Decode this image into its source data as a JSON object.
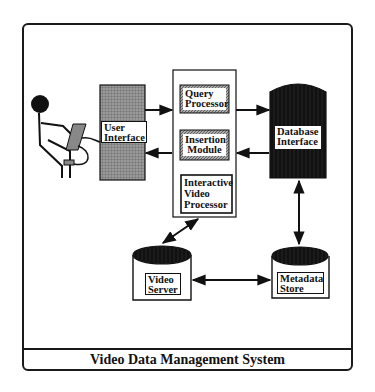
{
  "diagram": {
    "title": "Video Data Management System",
    "nodes": [
      {
        "id": "user",
        "label": "User",
        "shape": "stick-figure-with-tablet"
      },
      {
        "id": "user_interface",
        "label_line1": "User",
        "label_line2": "Interface",
        "shape": "grid-rect"
      },
      {
        "id": "query_processor",
        "label_line1": "Query",
        "label_line2": "Processor",
        "shape": "hatched-rect"
      },
      {
        "id": "insertion_module",
        "label_line1": "Insertion",
        "label_line2": "Module",
        "shape": "hatched-rect"
      },
      {
        "id": "interactive_video_processor",
        "label_line1": "Interactive",
        "label_line2": "Video",
        "label_line3": "Processor",
        "shape": "rect"
      },
      {
        "id": "database_interface",
        "label_line1": "Database",
        "label_line2": "Interface",
        "shape": "dark-cylinder"
      },
      {
        "id": "video_server",
        "label_line1": "Video",
        "label_line2": "Server",
        "shape": "cylinder"
      },
      {
        "id": "metadata_store",
        "label_line1": "Metadata",
        "label_line2": "Store",
        "shape": "cylinder"
      }
    ],
    "edges": [
      {
        "from": "user",
        "to": "user_interface",
        "style": "line"
      },
      {
        "from": "user_interface",
        "to": "query_processor",
        "style": "arrow"
      },
      {
        "from": "insertion_module",
        "to": "user_interface",
        "style": "arrow"
      },
      {
        "from": "query_processor",
        "to": "database_interface",
        "style": "arrow"
      },
      {
        "from": "database_interface",
        "to": "insertion_module",
        "style": "arrow"
      },
      {
        "from": "interactive_video_processor",
        "to": "video_server",
        "style": "bidirectional"
      },
      {
        "from": "database_interface",
        "to": "metadata_store",
        "style": "bidirectional"
      },
      {
        "from": "video_server",
        "to": "metadata_store",
        "style": "bidirectional"
      }
    ],
    "colors": {
      "ink": "#111111",
      "grid_fill": "#8a8a8a",
      "hatch_fill": "#9a9a9a",
      "dark_fill": "#111111",
      "background": "#ffffff"
    }
  }
}
